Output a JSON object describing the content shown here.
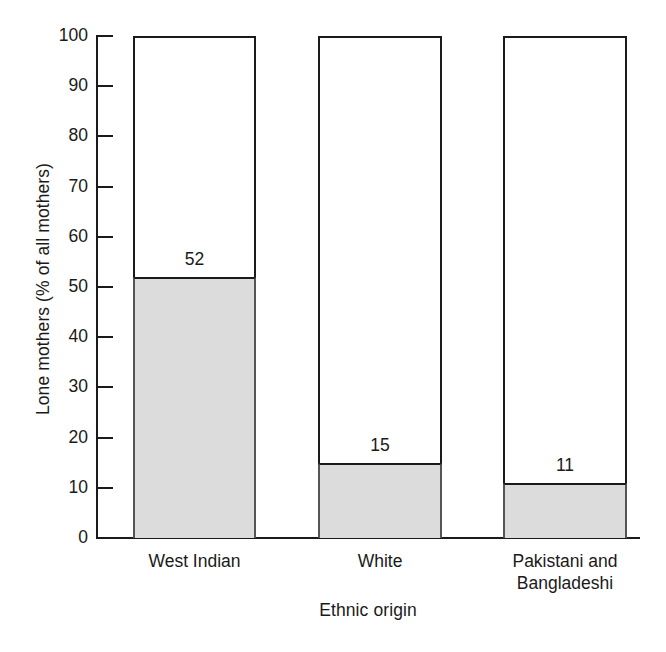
{
  "chart_data": {
    "type": "bar",
    "title": "",
    "subtitle": "",
    "categories": [
      "West Indian",
      "White",
      "Pakistani and\nBangladeshi"
    ],
    "values": [
      52,
      15,
      11
    ],
    "value_labels": [
      "52",
      "15",
      "11"
    ],
    "xlabel": "Ethnic origin",
    "ylabel": "Lone mothers (% of all mothers)",
    "ylim": [
      0,
      100
    ],
    "ytick_labels": [
      "0",
      "10",
      "20",
      "30",
      "40",
      "50",
      "60",
      "70",
      "80",
      "90",
      "100"
    ],
    "ytick_values": [
      0,
      10,
      20,
      30,
      40,
      50,
      60,
      70,
      80,
      90,
      100
    ],
    "grid": false,
    "legend": null,
    "colors": {
      "bar_fill": "#dcdcdc",
      "bar_outline": "#1a1a1a",
      "axis": "#1a1a1a",
      "text": "#1a1a1a",
      "background": "#ffffff"
    }
  },
  "geometry": {
    "plot_left": 96,
    "plot_right": 640,
    "plot_top": 36,
    "plot_bottom": 538,
    "bars": [
      {
        "left": 133,
        "right": 256
      },
      {
        "left": 318,
        "right": 442
      },
      {
        "left": 503,
        "right": 627
      }
    ]
  }
}
